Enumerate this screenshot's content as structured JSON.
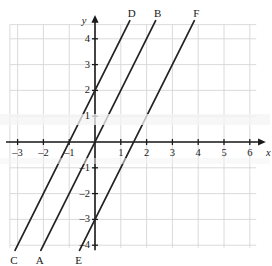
{
  "figure": {
    "kind": "coordinate-graph",
    "background": "#ffffff",
    "grid_color": "#d6d6d6",
    "axis_color": "#1a1a1a",
    "line_color": "#222222"
  },
  "axes": {
    "x_name": "x",
    "y_name": "y",
    "x_ticks": [
      "-3",
      "-2",
      "-1",
      "1",
      "2",
      "3",
      "4",
      "5",
      "6"
    ],
    "y_ticks": [
      "4",
      "3",
      "2",
      "1",
      "-1",
      "-2",
      "-3",
      "-4"
    ],
    "x_tick_values": [
      -3,
      -2,
      -1,
      1,
      2,
      3,
      4,
      5,
      6
    ],
    "y_tick_values": [
      4,
      3,
      2,
      1,
      -1,
      -2,
      -3,
      -4
    ]
  },
  "line_labels": {
    "D": "D",
    "B": "B",
    "F": "F",
    "C": "C",
    "A": "A",
    "E": "E"
  },
  "chart_data": {
    "type": "line",
    "title": "",
    "xlabel": "x",
    "ylabel": "y",
    "xlim": [
      -3.5,
      6.5
    ],
    "ylim": [
      -4.5,
      4.8
    ],
    "grid": true,
    "legend": "none",
    "xticks": [
      -3,
      -2,
      -1,
      1,
      2,
      3,
      4,
      5,
      6
    ],
    "yticks": [
      4,
      3,
      2,
      1,
      -1,
      -2,
      -3,
      -4
    ],
    "series": [
      {
        "name": "CD",
        "start_label": "C",
        "end_label": "D",
        "slope": 2,
        "intercept": 2,
        "equation": "y = 2x + 2",
        "x_intercept": -1,
        "y_intercept": 2,
        "x": [
          -3.1,
          1.35
        ],
        "y": [
          -4.2,
          4.7
        ]
      },
      {
        "name": "AB",
        "start_label": "A",
        "end_label": "B",
        "slope": 2,
        "intercept": 0,
        "equation": "y = 2x",
        "x_intercept": 0,
        "y_intercept": 0,
        "x": [
          -2.1,
          2.35
        ],
        "y": [
          -4.2,
          4.7
        ]
      },
      {
        "name": "EF",
        "start_label": "E",
        "end_label": "F",
        "slope": 2,
        "intercept": -3,
        "equation": "y = 2x - 3",
        "x_intercept": 1.5,
        "y_intercept": -3,
        "x": [
          -0.6,
          3.85
        ],
        "y": [
          -4.2,
          4.7
        ]
      }
    ]
  }
}
